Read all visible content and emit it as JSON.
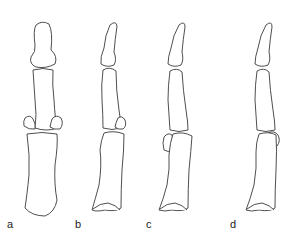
{
  "figure": {
    "panels": [
      {
        "id": "a",
        "label": "a",
        "view": "frontal"
      },
      {
        "id": "b",
        "label": "b",
        "view": "lateral"
      },
      {
        "id": "c",
        "label": "c",
        "view": "lateral"
      },
      {
        "id": "d",
        "label": "d",
        "view": "lateral"
      }
    ],
    "stroke_color": "#3a3a3a",
    "background": "#ffffff"
  }
}
